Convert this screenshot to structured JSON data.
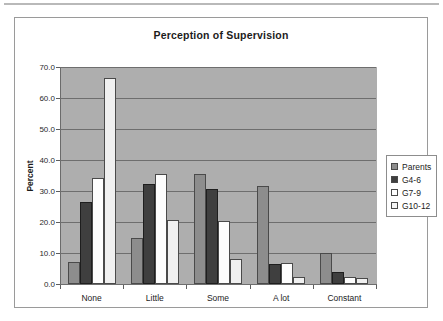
{
  "chart_data": {
    "type": "bar",
    "title": "Perception of Supervision",
    "xlabel": "",
    "ylabel": "Percent",
    "ylim": [
      0.0,
      70.0
    ],
    "ytick_step": 10.0,
    "ytick_labels": [
      "0.0",
      "10.0",
      "20.0",
      "30.0",
      "40.0",
      "50.0",
      "60.0",
      "70.0"
    ],
    "grid": true,
    "legend_position": "right",
    "categories": [
      "None",
      "Little",
      "Some",
      "A lot",
      "Constant"
    ],
    "series": [
      {
        "name": "Parents",
        "color": "#8d8d8d",
        "values": [
          7.2,
          14.9,
          35.6,
          31.5,
          10.0
        ]
      },
      {
        "name": "G4-6",
        "color": "#3f3f3f",
        "values": [
          26.5,
          32.3,
          30.5,
          6.4,
          3.9
        ]
      },
      {
        "name": "G7-9",
        "color": "#fdfdfd",
        "values": [
          34.1,
          35.6,
          20.2,
          6.9,
          2.4
        ]
      },
      {
        "name": "G10-12",
        "color": "#f0f0f0",
        "values": [
          66.3,
          20.6,
          8.1,
          2.4,
          1.8
        ]
      }
    ],
    "plot_background": "#aeaeae",
    "figure_background": "#ffffff"
  }
}
